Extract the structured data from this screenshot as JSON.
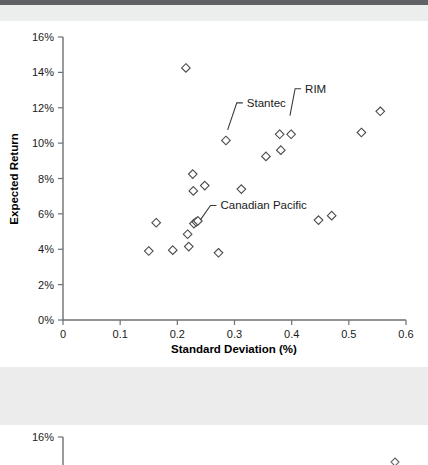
{
  "document": {
    "top_bar_color": "#606265",
    "band_color": "#ececec",
    "background_color": "#ffffff"
  },
  "chart_data": {
    "type": "scatter",
    "title": "",
    "xlabel": "Standard Deviation (%)",
    "ylabel": "Expected Return",
    "xlim": [
      0,
      0.6
    ],
    "ylim": [
      0,
      16
    ],
    "xticks": [
      0,
      0.1,
      0.2,
      0.3,
      0.4,
      0.5,
      0.6
    ],
    "xtick_labels": [
      "0",
      "0.1",
      "0.2",
      "0.3",
      "0.4",
      "0.5",
      "0.6"
    ],
    "yticks": [
      0,
      2,
      4,
      6,
      8,
      10,
      12,
      14,
      16
    ],
    "ytick_labels": [
      "0%",
      "2%",
      "4%",
      "6%",
      "8%",
      "10%",
      "12%",
      "14%",
      "16%"
    ],
    "grid": false,
    "legend": null,
    "marker_style": "open-diamond",
    "points": [
      {
        "x": 0.15,
        "y": 3.9
      },
      {
        "x": 0.163,
        "y": 5.5
      },
      {
        "x": 0.192,
        "y": 3.95
      },
      {
        "x": 0.215,
        "y": 14.25
      },
      {
        "x": 0.218,
        "y": 4.85
      },
      {
        "x": 0.22,
        "y": 4.15
      },
      {
        "x": 0.227,
        "y": 8.25
      },
      {
        "x": 0.228,
        "y": 7.3
      },
      {
        "x": 0.229,
        "y": 5.45
      },
      {
        "x": 0.233,
        "y": 5.55
      },
      {
        "x": 0.236,
        "y": 5.6
      },
      {
        "x": 0.248,
        "y": 7.6
      },
      {
        "x": 0.272,
        "y": 3.8
      },
      {
        "x": 0.285,
        "y": 10.15
      },
      {
        "x": 0.312,
        "y": 7.4
      },
      {
        "x": 0.355,
        "y": 9.25
      },
      {
        "x": 0.379,
        "y": 10.5
      },
      {
        "x": 0.381,
        "y": 9.6
      },
      {
        "x": 0.399,
        "y": 10.5
      },
      {
        "x": 0.447,
        "y": 5.65
      },
      {
        "x": 0.47,
        "y": 5.9
      },
      {
        "x": 0.522,
        "y": 10.6
      },
      {
        "x": 0.555,
        "y": 11.8
      }
    ],
    "annotations": [
      {
        "label": "Stantec",
        "text_x": 0.318,
        "text_y": 12.05,
        "target_x": 0.288,
        "target_y": 10.75
      },
      {
        "label": "RIM",
        "text_x": 0.42,
        "text_y": 12.85,
        "target_x": 0.397,
        "target_y": 11.55
      },
      {
        "label": "Canadian Pacific",
        "text_x": 0.272,
        "text_y": 6.25,
        "target_x": 0.24,
        "target_y": 5.65
      }
    ]
  },
  "chart_secondary": {
    "type": "scatter",
    "ytick_labels": [
      "16%"
    ],
    "note": "partially visible chart below"
  }
}
